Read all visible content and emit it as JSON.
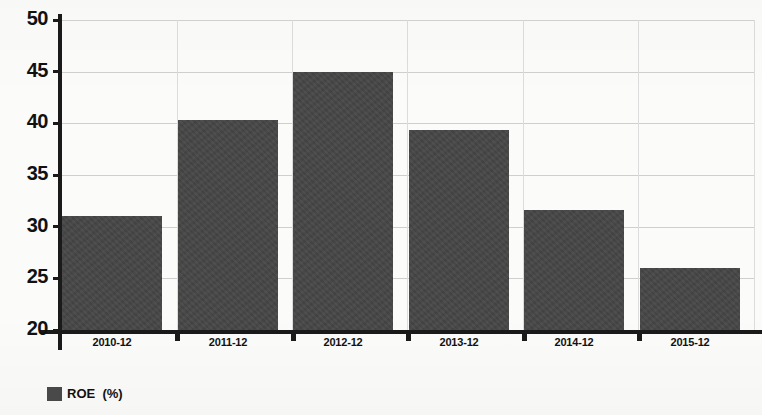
{
  "chart_data": {
    "type": "bar",
    "title": "",
    "subtitle": "",
    "xlabel": "",
    "ylabel": "",
    "categories": [
      "2010-12",
      "2011-12",
      "2012-12",
      "2013-12",
      "2014-12",
      "2015-12"
    ],
    "series": [
      {
        "name": "ROE  (%)",
        "values": [
          31.0,
          40.3,
          45.0,
          39.4,
          31.6,
          26.0
        ],
        "color": "#464646"
      }
    ],
    "ylim": [
      20,
      50
    ],
    "ytick_labels": [
      "50",
      "45",
      "40",
      "35",
      "30",
      "25",
      "20"
    ],
    "ytick_values": [
      50,
      45,
      40,
      35,
      30,
      25,
      20
    ],
    "grid": "horizontal-and-vertical",
    "legend": {
      "position": "bottom-left",
      "entries": [
        {
          "label": "ROE  (%)",
          "swatch_color": "#4a4a4a"
        }
      ]
    },
    "axis_color": "#1a1a1a",
    "gridline_color": "#cfcfcf",
    "background_color": "#fbfbfa"
  }
}
